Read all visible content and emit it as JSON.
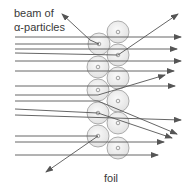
{
  "diagram": {
    "labels": {
      "beam_line1": "beam of",
      "beam_line2": "α-particles",
      "foil": "foil"
    },
    "colors": {
      "line": "#555555",
      "atom_stroke": "#9a9a9a",
      "atom_fill": "#eeeeee",
      "nucleus": "#8a8a8a",
      "text": "#3a3a3a"
    },
    "atoms": [
      {
        "cx": 99,
        "cy": 44,
        "r": 11
      },
      {
        "cx": 98,
        "cy": 67,
        "r": 11
      },
      {
        "cx": 98,
        "cy": 90,
        "r": 11
      },
      {
        "cx": 98,
        "cy": 113,
        "r": 11
      },
      {
        "cx": 98,
        "cy": 136,
        "r": 11
      },
      {
        "cx": 118,
        "cy": 32,
        "r": 11
      },
      {
        "cx": 118,
        "cy": 55,
        "r": 11
      },
      {
        "cx": 118,
        "cy": 78,
        "r": 11
      },
      {
        "cx": 118,
        "cy": 101,
        "r": 11
      },
      {
        "cx": 118,
        "cy": 123,
        "r": 11
      },
      {
        "cx": 118,
        "cy": 148,
        "r": 11
      }
    ],
    "paths": [
      {
        "points": [
          [
            15,
            37
          ],
          [
            181,
            37
          ]
        ],
        "arrow": true
      },
      {
        "points": [
          [
            15,
            44
          ],
          [
            99,
            44
          ],
          [
            90,
            40
          ],
          [
            62,
            14
          ]
        ],
        "arrow": true
      },
      {
        "points": [
          [
            15,
            49
          ],
          [
            177,
            49
          ]
        ],
        "arrow": true
      },
      {
        "points": [
          [
            15,
            53
          ],
          [
            118,
            55
          ],
          [
            178,
            14
          ]
        ],
        "arrow": true
      },
      {
        "points": [
          [
            15,
            61
          ],
          [
            181,
            61
          ]
        ],
        "arrow": true
      },
      {
        "points": [
          [
            15,
            71
          ],
          [
            174,
            71
          ]
        ],
        "arrow": true
      },
      {
        "points": [
          [
            15,
            86
          ],
          [
            175,
            86
          ]
        ],
        "arrow": true
      },
      {
        "points": [
          [
            15,
            95
          ],
          [
            98,
            95
          ],
          [
            165,
            75
          ]
        ],
        "arrow": true
      },
      {
        "points": [
          [
            15,
            101
          ],
          [
            98,
            101
          ],
          [
            177,
            134
          ]
        ],
        "arrow": true
      },
      {
        "points": [
          [
            15,
            115
          ],
          [
            181,
            120
          ]
        ],
        "arrow": true
      },
      {
        "points": [
          [
            15,
            109
          ],
          [
            98,
            113
          ],
          [
            172,
            138
          ]
        ],
        "arrow": true
      },
      {
        "points": [
          [
            15,
            136
          ],
          [
            98,
            136
          ],
          [
            46,
            172
          ]
        ],
        "arrow": true
      },
      {
        "points": [
          [
            15,
            142
          ],
          [
            164,
            142
          ]
        ],
        "arrow": true
      },
      {
        "points": [
          [
            15,
            155
          ],
          [
            158,
            155
          ]
        ],
        "arrow": true
      }
    ]
  }
}
